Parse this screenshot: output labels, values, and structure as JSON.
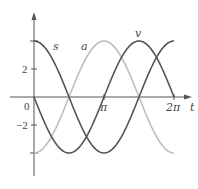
{
  "chart_data": {
    "type": "line",
    "title": "",
    "xlabel": "t",
    "ylabel": "",
    "xlim": [
      0,
      6.2832
    ],
    "ylim": [
      -4,
      4
    ],
    "grid": false,
    "x_ticks": [
      {
        "value": 0,
        "label": "0"
      },
      {
        "value": 3.1416,
        "label": "π"
      },
      {
        "value": 6.2832,
        "label": "2π"
      }
    ],
    "y_ticks": [
      {
        "value": 4,
        "label": ""
      },
      {
        "value": 2,
        "label": "2"
      },
      {
        "value": -2,
        "label": "−2"
      },
      {
        "value": -4,
        "label": ""
      }
    ],
    "series": [
      {
        "name": "s",
        "formula": "4cos(t)",
        "amplitude": 4,
        "phase": "cos",
        "sign": 1,
        "color": "#555555",
        "x": [
          0,
          1.5708,
          3.1416,
          4.7124,
          6.2832
        ],
        "values": [
          4,
          0,
          -4,
          0,
          4
        ]
      },
      {
        "name": "v",
        "formula": "-4sin(t)",
        "amplitude": 4,
        "phase": "sin",
        "sign": -1,
        "color": "#555555",
        "x": [
          0,
          1.5708,
          3.1416,
          4.7124,
          6.2832
        ],
        "values": [
          0,
          -4,
          0,
          4,
          0
        ]
      },
      {
        "name": "a",
        "formula": "-4cos(t)",
        "amplitude": 4,
        "phase": "cos",
        "sign": -1,
        "color": "#bdbdbd",
        "x": [
          0,
          1.5708,
          3.1416,
          4.7124,
          6.2832
        ],
        "values": [
          -4,
          0,
          4,
          0,
          -4
        ]
      }
    ],
    "annotations": [
      {
        "text": "s",
        "series": "s"
      },
      {
        "text": "a",
        "series": "a"
      },
      {
        "text": "v",
        "series": "v"
      }
    ]
  },
  "labels": {
    "s": "s",
    "a": "a",
    "v": "v",
    "t_axis": "t",
    "origin": "0",
    "pi": "π",
    "two_pi": "2π",
    "y_two": "2",
    "y_neg_two": "−2"
  }
}
